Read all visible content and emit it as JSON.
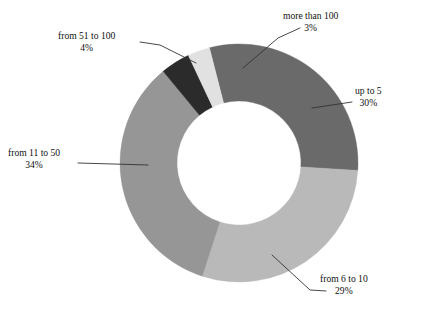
{
  "chart_data": {
    "type": "pie",
    "variant": "donut",
    "title": "",
    "subtitle": "",
    "xlabel": "",
    "ylabel": "",
    "grid": false,
    "legend_position": "none",
    "labels_inline": true,
    "unit": "%",
    "start_angle_deg": -14.4,
    "direction": "clockwise",
    "categories": [
      "up to 5",
      "from 6 to 10",
      "from 11 to 50",
      "from 51 to 100",
      "more than 100"
    ],
    "values": [
      30,
      29,
      34,
      4,
      3
    ],
    "value_labels": [
      "30%",
      "29%",
      "34%",
      "4%",
      "3%"
    ],
    "colors": [
      "#6a6a6a",
      "#b9b9b9",
      "#969696",
      "#2b2b2b",
      "#e1e1e1"
    ],
    "slices": [
      {
        "label": "up to 5",
        "value": 30,
        "value_label": "30%",
        "color": "#6a6a6a"
      },
      {
        "label": "from 6 to 10",
        "value": 29,
        "value_label": "29%",
        "color": "#b9b9b9"
      },
      {
        "label": "from 11 to 50",
        "value": 34,
        "value_label": "34%",
        "color": "#969696"
      },
      {
        "label": "from 51 to 100",
        "value": 4,
        "value_label": "4%",
        "color": "#2b2b2b"
      },
      {
        "label": "more than 100",
        "value": 3,
        "value_label": "3%",
        "color": "#e1e1e1"
      }
    ]
  },
  "canvas": {
    "background": "#ffffff",
    "center_x": 239,
    "center_y": 163,
    "outer_radius": 119,
    "inner_radius": 62,
    "leader_color": "#333333"
  }
}
